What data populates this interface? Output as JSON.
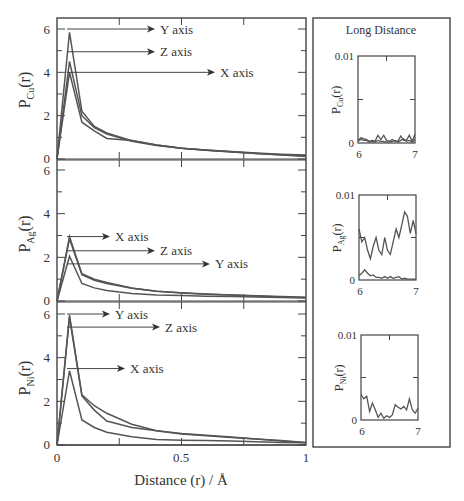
{
  "figure": {
    "xlabel": "Distance (r) / Å",
    "inset_panel_title": "Long Distance",
    "main_x_ticks": [
      "0",
      "0.5",
      "1"
    ],
    "main_y_ticks": [
      "0",
      "2",
      "4",
      "6"
    ],
    "inset_x_ticks": [
      "6",
      "7"
    ],
    "inset_y_ticks": [
      "0",
      "0.01"
    ],
    "panels": [
      {
        "element": "Cu",
        "ylabel_main": "P",
        "ylabel_sub": "Cu",
        "ylabel_tail": "(r)",
        "annotations": [
          "Y axis",
          "Z axis",
          "X axis"
        ]
      },
      {
        "element": "Ag",
        "ylabel_main": "P",
        "ylabel_sub": "Ag",
        "ylabel_tail": "(r)",
        "annotations": [
          "X axis",
          "Z axis",
          "Y axis"
        ]
      },
      {
        "element": "Ni",
        "ylabel_main": "P",
        "ylabel_sub": "Ni",
        "ylabel_tail": "(r)",
        "annotations": [
          "Y axis",
          "Z axis",
          "X axis"
        ]
      }
    ]
  },
  "chart_data": [
    {
      "type": "line",
      "title": "",
      "xlabel": "",
      "ylabel": "P_Cu(r)",
      "xlim": [
        0,
        1
      ],
      "ylim": [
        0,
        6.5
      ],
      "x": [
        0,
        0.05,
        0.1,
        0.15,
        0.2,
        0.3,
        0.4,
        0.5,
        0.6,
        0.7,
        0.8,
        0.9,
        1.0
      ],
      "series": [
        {
          "name": "Y axis",
          "values": [
            0,
            5.85,
            2.2,
            1.5,
            1.2,
            0.85,
            0.65,
            0.5,
            0.42,
            0.35,
            0.28,
            0.22,
            0.18
          ]
        },
        {
          "name": "Z axis",
          "values": [
            0,
            4.5,
            2.0,
            1.45,
            1.15,
            0.82,
            0.62,
            0.5,
            0.4,
            0.33,
            0.26,
            0.2,
            0.15
          ]
        },
        {
          "name": "X axis",
          "values": [
            0,
            4.0,
            1.7,
            1.3,
            0.95,
            0.85,
            0.65,
            0.5,
            0.4,
            0.32,
            0.25,
            0.18,
            0.12
          ]
        }
      ],
      "annotations": [
        "Y axis",
        "Z axis",
        "X axis"
      ],
      "grid": false
    },
    {
      "type": "line",
      "title": "",
      "xlabel": "",
      "ylabel": "P_Ag(r)",
      "xlim": [
        0,
        1
      ],
      "ylim": [
        0,
        6.5
      ],
      "x": [
        0,
        0.05,
        0.1,
        0.15,
        0.2,
        0.3,
        0.4,
        0.5,
        0.6,
        0.7,
        0.8,
        0.9,
        1.0
      ],
      "series": [
        {
          "name": "X axis",
          "values": [
            0,
            2.95,
            1.25,
            1.0,
            0.85,
            0.6,
            0.45,
            0.38,
            0.32,
            0.28,
            0.24,
            0.2,
            0.17
          ]
        },
        {
          "name": "Z axis",
          "values": [
            0,
            2.85,
            1.2,
            0.95,
            0.8,
            0.58,
            0.45,
            0.37,
            0.31,
            0.27,
            0.23,
            0.19,
            0.16
          ]
        },
        {
          "name": "Y axis",
          "values": [
            0,
            2.05,
            0.8,
            0.6,
            0.48,
            0.35,
            0.28,
            0.25,
            0.22,
            0.2,
            0.18,
            0.16,
            0.14
          ]
        }
      ],
      "annotations": [
        "X axis",
        "Z axis",
        "Y axis"
      ],
      "grid": false
    },
    {
      "type": "line",
      "title": "",
      "xlabel": "Distance (r) / Å",
      "ylabel": "P_Ni(r)",
      "xlim": [
        0,
        1
      ],
      "ylim": [
        0,
        6.5
      ],
      "x": [
        0,
        0.05,
        0.1,
        0.15,
        0.2,
        0.3,
        0.4,
        0.5,
        0.6,
        0.7,
        0.8,
        0.9,
        1.0
      ],
      "series": [
        {
          "name": "Y axis",
          "values": [
            0,
            5.95,
            2.3,
            1.8,
            1.45,
            0.95,
            0.65,
            0.5,
            0.42,
            0.35,
            0.28,
            0.18,
            0.1
          ]
        },
        {
          "name": "Z axis",
          "values": [
            0,
            5.85,
            2.25,
            1.6,
            1.1,
            0.8,
            0.65,
            0.52,
            0.45,
            0.36,
            0.28,
            0.2,
            0.12
          ]
        },
        {
          "name": "X axis",
          "values": [
            0,
            3.4,
            1.15,
            0.8,
            0.58,
            0.38,
            0.25,
            0.22,
            0.2,
            0.18,
            0.15,
            0.12,
            0.1
          ]
        }
      ],
      "annotations": [
        "Y axis",
        "Z axis",
        "X axis"
      ],
      "grid": false
    },
    {
      "type": "line",
      "title": "Long Distance",
      "xlabel": "",
      "ylabel": "P_Cu(r)",
      "xlim": [
        6,
        7
      ],
      "ylim": [
        0,
        0.01
      ],
      "x": [
        6.0,
        6.05,
        6.1,
        6.15,
        6.2,
        6.25,
        6.3,
        6.35,
        6.4,
        6.45,
        6.5,
        6.55,
        6.6,
        6.65,
        6.7,
        6.75,
        6.8,
        6.85,
        6.9,
        6.95,
        7.0
      ],
      "series": [
        {
          "name": "series-1",
          "values": [
            0.0003,
            0.0006,
            0.0005,
            0.0004,
            0.0002,
            0.0003,
            0.0002,
            0.0009,
            0.0004,
            0.0009,
            0.0003,
            0.0002,
            0.0004,
            0.0002,
            0.0002,
            0.0008,
            0.0003,
            0.0003,
            0.0009,
            0.0002,
            0.001
          ]
        },
        {
          "name": "series-2",
          "values": [
            0.0002,
            0.0004,
            0.0003,
            0.0003,
            0.0001,
            0.0002,
            0.0001,
            0.0003,
            0.0002,
            0.0002,
            0.0001,
            0.0001,
            0.0002,
            0.0003,
            0.0001,
            0.0003,
            0.0005,
            0.0002,
            0.0003,
            0.0001,
            0.0004
          ]
        }
      ],
      "grid": false
    },
    {
      "type": "line",
      "title": "",
      "xlabel": "",
      "ylabel": "P_Ag(r)",
      "xlim": [
        6,
        7
      ],
      "ylim": [
        0,
        0.01
      ],
      "x": [
        6.0,
        6.05,
        6.1,
        6.15,
        6.2,
        6.25,
        6.3,
        6.35,
        6.4,
        6.45,
        6.5,
        6.55,
        6.6,
        6.65,
        6.7,
        6.75,
        6.8,
        6.85,
        6.9,
        6.95,
        7.0
      ],
      "series": [
        {
          "name": "series-1",
          "values": [
            0.006,
            0.0045,
            0.005,
            0.0035,
            0.0025,
            0.004,
            0.005,
            0.0035,
            0.003,
            0.005,
            0.0035,
            0.003,
            0.0045,
            0.006,
            0.005,
            0.0065,
            0.008,
            0.0075,
            0.0055,
            0.007,
            0.0055
          ]
        },
        {
          "name": "series-2",
          "values": [
            0.0005,
            0.0008,
            0.0012,
            0.0008,
            0.0005,
            0.0006,
            0.0003,
            0.0003,
            0.0002,
            0.0004,
            0.0002,
            0.0004,
            0.0002,
            0.0003,
            0.0004,
            0.0001,
            0.0002,
            0.0001,
            0.0001,
            0.0001,
            0.0001
          ]
        }
      ],
      "grid": false
    },
    {
      "type": "line",
      "title": "",
      "xlabel": "",
      "ylabel": "P_Ni(r)",
      "xlim": [
        6,
        7
      ],
      "ylim": [
        0,
        0.01
      ],
      "x": [
        6.0,
        6.05,
        6.1,
        6.15,
        6.2,
        6.25,
        6.3,
        6.35,
        6.4,
        6.45,
        6.5,
        6.55,
        6.6,
        6.65,
        6.7,
        6.75,
        6.8,
        6.85,
        6.9,
        6.95,
        7.0
      ],
      "series": [
        {
          "name": "series-1",
          "values": [
            0.003,
            0.0025,
            0.0028,
            0.001,
            0.002,
            0.0012,
            0.0003,
            0.0008,
            0.0002,
            0.0005,
            0.0003,
            0.0006,
            0.0018,
            0.0015,
            0.0013,
            0.0016,
            0.0012,
            0.0025,
            0.0012,
            0.0008,
            0.0014
          ]
        }
      ],
      "grid": false
    }
  ]
}
